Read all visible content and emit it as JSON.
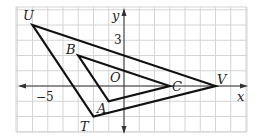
{
  "diagram": {
    "type": "coordinate-plane-triangles",
    "grid": {
      "origin_px": [
        124,
        86
      ],
      "unit_px": 15.25,
      "x_range": [
        -7,
        8
      ],
      "y_range": [
        -3,
        5
      ],
      "line_color": "#d4d4d4",
      "axis_color": "#333333"
    },
    "axes": {
      "x_label": "x",
      "y_label": "y",
      "origin_label": "O",
      "ticks": [
        {
          "axis": "x",
          "value": -5,
          "label": "−5"
        },
        {
          "axis": "y",
          "value": 3,
          "label": "3"
        }
      ]
    },
    "triangles": [
      {
        "name": "UVT",
        "vertices": [
          {
            "label": "U",
            "x": -6,
            "y": 4
          },
          {
            "label": "V",
            "x": 6,
            "y": 0
          },
          {
            "label": "T",
            "x": -2,
            "y": -2
          }
        ],
        "stroke": "#111111"
      },
      {
        "name": "BCA",
        "vertices": [
          {
            "label": "B",
            "x": -3,
            "y": 2
          },
          {
            "label": "C",
            "x": 3,
            "y": 0
          },
          {
            "label": "A",
            "x": -1,
            "y": -1
          }
        ],
        "stroke": "#111111"
      }
    ]
  }
}
